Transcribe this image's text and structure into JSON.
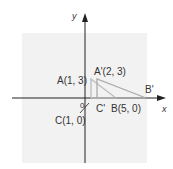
{
  "diagram": {
    "axes": {
      "x_label": "x",
      "y_label": "y",
      "origin_label": "0"
    },
    "points": {
      "A": "A(1, 3)",
      "A_prime": "A'(2, 3)",
      "B": "B(5, 0)",
      "B_prime": "B'",
      "C": "C(1, 0)",
      "C_prime": "C'"
    },
    "colors": {
      "background": "#f2f2f2",
      "axis": "#222222",
      "triangle": "#b5b5b5"
    }
  }
}
